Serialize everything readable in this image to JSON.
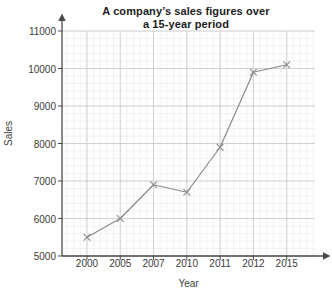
{
  "chart_data": {
    "type": "line",
    "title_lines": [
      "A company’s sales figures over",
      "a 15-year period"
    ],
    "xlabel": "Year",
    "ylabel": "Sales",
    "categories": [
      "2000",
      "2005",
      "2007",
      "2010",
      "2011",
      "2012",
      "2015"
    ],
    "values": [
      5500,
      6000,
      6900,
      6700,
      7900,
      9900,
      10100
    ],
    "series": [
      {
        "name": "Sales",
        "values": [
          5500,
          6000,
          6900,
          6700,
          7900,
          9900,
          10100
        ]
      }
    ],
    "ylim": [
      5000,
      11000
    ],
    "y_ticks": [
      5000,
      6000,
      7000,
      8000,
      9000,
      10000,
      11000
    ],
    "y_tick_labels": [
      "5000",
      "6000",
      "7000",
      "8000",
      "9000",
      "10000",
      "11000"
    ],
    "x_tick_labels": [
      "2000",
      "2005",
      "2007",
      "2010",
      "2011",
      "2012",
      "2015"
    ],
    "grid": true,
    "minor_grid": true,
    "minor_divisions": 5,
    "legend": "none",
    "marker": "x-cross",
    "line_color": "#8a8a8a",
    "marker_color": "#8a8a8a",
    "grid_major_color": "#c9c9c9",
    "grid_minor_color": "#e4e4e4",
    "axis_color": "#4a4a4a",
    "plot_background": "#ffffff",
    "axis_arrows": [
      "y-top",
      "x-right"
    ]
  }
}
